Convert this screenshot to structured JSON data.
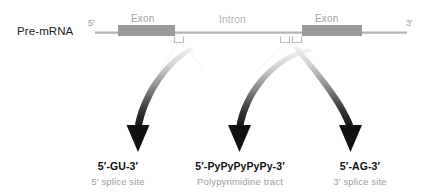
{
  "figure": {
    "molecule_label": "Pre-mRNA",
    "end_5": "5′",
    "end_3": "3′",
    "colors": {
      "exon_fill": "#9a9a9a",
      "backbone": "#b3b3b3",
      "arrow_dark": "#111111",
      "arrow_light": "#e8e8e8",
      "label_gray": "#a3a3a3",
      "text_dark": "#111111",
      "background": "#ffffff"
    },
    "segments": [
      {
        "id": "exon-left",
        "label": "Exon"
      },
      {
        "id": "intron",
        "label": "Intron"
      },
      {
        "id": "exon-right",
        "label": "Exon"
      }
    ],
    "sites": [
      {
        "id": "five-prime-splice-site",
        "sequence": "5′-GU-3′",
        "name": "5′ splice site"
      },
      {
        "id": "polypyrimidine-tract",
        "sequence": "5′-PyPyPyPyPy-3′",
        "name": "Polypyrimidine tract"
      },
      {
        "id": "three-prime-splice-site",
        "sequence": "5′-AG-3′",
        "name": "3′ splice site"
      }
    ]
  }
}
